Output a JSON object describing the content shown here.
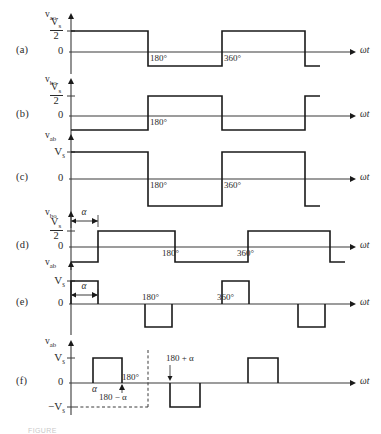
{
  "figure": {
    "axis_x_origin": 71,
    "axis_x_end": 356,
    "degree_180_x": 148,
    "degree_360_x": 222,
    "alpha_x": 98,
    "wt_label": "ωt",
    "tick_180": "180°",
    "tick_360": "360°",
    "alpha_label": "α",
    "caption": "FIGURE"
  },
  "panels": [
    {
      "id": "a",
      "tag": "(a)",
      "signal": "v",
      "signal_sub": "ao",
      "amplitude_type": "fraction",
      "amplitude_num": "V",
      "amplitude_num_sub": "s",
      "amplitude_den": "2",
      "zero_label": "0",
      "baseline_y": 52,
      "high_y": 31,
      "low_y": 66,
      "ticks": [
        "180°",
        "360°"
      ],
      "tick_positions": [
        148,
        222
      ],
      "segments": [
        {
          "from": 71,
          "to": 148,
          "level": "high"
        },
        {
          "from": 148,
          "to": 222,
          "level": "low"
        },
        {
          "from": 222,
          "to": 305,
          "level": "high"
        },
        {
          "from": 305,
          "to": 320,
          "level": "low"
        }
      ]
    },
    {
      "id": "b",
      "tag": "(b)",
      "signal": "v",
      "signal_sub": "bo",
      "amplitude_type": "fraction",
      "amplitude_num": "V",
      "amplitude_num_sub": "s",
      "amplitude_den": "2",
      "zero_label": "0",
      "baseline_y": 116,
      "high_y": 96,
      "low_y": 130,
      "ticks": [
        "180°"
      ],
      "tick_positions": [
        148
      ],
      "segments": [
        {
          "from": 71,
          "to": 148,
          "level": "low"
        },
        {
          "from": 148,
          "to": 222,
          "level": "high"
        },
        {
          "from": 222,
          "to": 305,
          "level": "low"
        },
        {
          "from": 305,
          "to": 320,
          "level": "high"
        }
      ]
    },
    {
      "id": "c",
      "tag": "(c)",
      "signal": "v",
      "signal_sub": "ab",
      "amplitude_type": "plain",
      "amplitude_label": "V",
      "amplitude_label_sub": "s",
      "zero_label": "0",
      "baseline_y": 179,
      "high_y": 152,
      "low_y": 206,
      "ticks": [
        "180°",
        "360°"
      ],
      "tick_positions": [
        148,
        222
      ],
      "segments": [
        {
          "from": 71,
          "to": 148,
          "level": "high"
        },
        {
          "from": 148,
          "to": 222,
          "level": "low"
        },
        {
          "from": 222,
          "to": 305,
          "level": "high"
        },
        {
          "from": 305,
          "to": 320,
          "level": "low"
        }
      ]
    },
    {
      "id": "d",
      "tag": "(d)",
      "signal": "v",
      "signal_sub": "bo",
      "amplitude_type": "fraction",
      "amplitude_num": "V",
      "amplitude_num_sub": "s",
      "amplitude_den": "2",
      "zero_label": "0",
      "baseline_y": 247,
      "high_y": 231,
      "low_y": 262,
      "ticks": [
        "180°",
        "360°"
      ],
      "tick_positions": [
        160,
        235
      ],
      "has_alpha_marker": true,
      "alpha_from": 71,
      "alpha_to": 98,
      "alpha_marker_y": 221,
      "segments": [
        {
          "from": 71,
          "to": 98,
          "level": "low"
        },
        {
          "from": 98,
          "to": 175,
          "level": "high"
        },
        {
          "from": 175,
          "to": 248,
          "level": "low"
        },
        {
          "from": 248,
          "to": 330,
          "level": "high"
        },
        {
          "from": 330,
          "to": 345,
          "level": "low"
        }
      ]
    },
    {
      "id": "e",
      "tag": "(e)",
      "signal": "v",
      "signal_sub": "ab",
      "amplitude_type": "plain",
      "amplitude_label": "V",
      "amplitude_label_sub": "s",
      "zero_label": "0",
      "baseline_y": 304,
      "high_y": 281,
      "low_y": 327,
      "ticks": [
        "180°",
        "360°"
      ],
      "tick_positions": [
        140,
        215
      ],
      "has_alpha_marker": true,
      "alpha_from": 71,
      "alpha_to": 98,
      "alpha_marker_y": 295,
      "pulses": [
        {
          "from": 71,
          "to": 98,
          "level": "high"
        },
        {
          "from": 145,
          "to": 172,
          "level": "low"
        },
        {
          "from": 222,
          "to": 249,
          "level": "high"
        },
        {
          "from": 298,
          "to": 325,
          "level": "low"
        }
      ]
    },
    {
      "id": "f",
      "tag": "(f)",
      "signal": "v",
      "signal_sub": "ab",
      "amplitude_type": "plain",
      "amplitude_label": "V",
      "amplitude_label_sub": "s",
      "amplitude_neg_label": "−V",
      "amplitude_neg_sub": "s",
      "zero_label": "0",
      "baseline_y": 383,
      "high_y": 358,
      "low_y": 407,
      "dashed_x": 148,
      "tick_180": "180°",
      "annotation_minus": "180 − α",
      "annotation_plus": "180 + α",
      "alpha_label": "α",
      "pulses": [
        {
          "from": 93,
          "to": 122,
          "level": "high"
        },
        {
          "from": 170,
          "to": 200,
          "level": "low"
        },
        {
          "from": 248,
          "to": 278,
          "level": "high"
        }
      ]
    }
  ]
}
